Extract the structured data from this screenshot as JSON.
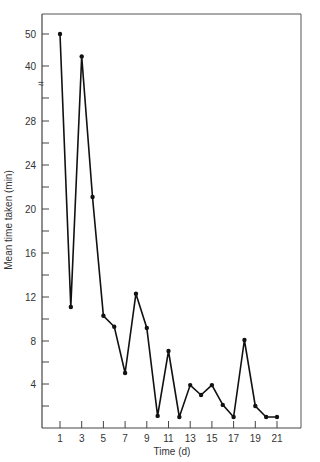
{
  "chart_data": {
    "type": "line",
    "title": "",
    "xlabel": "Time (d)",
    "ylabel": "Mean time taken (min)",
    "x": [
      1,
      2,
      3,
      4,
      5,
      6,
      7,
      8,
      9,
      10,
      11,
      12,
      13,
      14,
      15,
      16,
      17,
      18,
      19,
      20,
      21
    ],
    "series": [
      {
        "name": "Mean time taken",
        "values": [
          50,
          11,
          43,
          21,
          10.2,
          9.2,
          5,
          12.2,
          9.1,
          1.1,
          7,
          1,
          3.9,
          3,
          3.9,
          2.1,
          1,
          8,
          2,
          1,
          1
        ]
      }
    ],
    "x_tick_labels": [
      "1",
      "3",
      "5",
      "7",
      "9",
      "11",
      "13",
      "15",
      "17",
      "19",
      "21"
    ],
    "y_tick_labels": [
      "4",
      "8",
      "12",
      "16",
      "20",
      "24",
      "28",
      "40",
      "50"
    ],
    "y_axis_break": "between 28 and 40",
    "grid": false,
    "legend": "none"
  },
  "labels": {
    "xlabel": "Time (d)",
    "ylabel": "Mean time taken (min)",
    "break_symbol": "≈"
  }
}
